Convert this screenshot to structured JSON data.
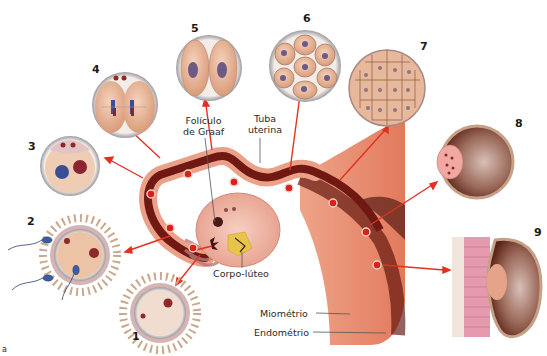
{
  "labels": {
    "foliculo_line1": "Folículo",
    "foliculo_line2": "de Graaf",
    "tuba_line1": "Tuba",
    "tuba_line2": "uterina",
    "corpo_luteo": "Corpo-lúteo",
    "miometrio": "Miométrio",
    "endometrio": "Endométrio",
    "figure_letter": "a"
  },
  "stages": [
    {
      "number": "1",
      "description": "oocyte with corona radiata"
    },
    {
      "number": "2",
      "description": "fertilization by sperm"
    },
    {
      "number": "3",
      "description": "zygote with two pronuclei"
    },
    {
      "number": "4",
      "description": "first mitotic division"
    },
    {
      "number": "5",
      "description": "two-cell stage"
    },
    {
      "number": "6",
      "description": "eight-cell stage"
    },
    {
      "number": "7",
      "description": "morula"
    },
    {
      "number": "8",
      "description": "blastocyst"
    },
    {
      "number": "9",
      "description": "implantation in endometrium"
    }
  ],
  "colors": {
    "arrow": "#e0321f",
    "tube_outer": "#e9957e",
    "tube_lumen": "#6e1510",
    "marker": "#d9201a",
    "cell": "#e6b08f",
    "nucleus": "#6e5a86",
    "uterus": "#e68568"
  }
}
